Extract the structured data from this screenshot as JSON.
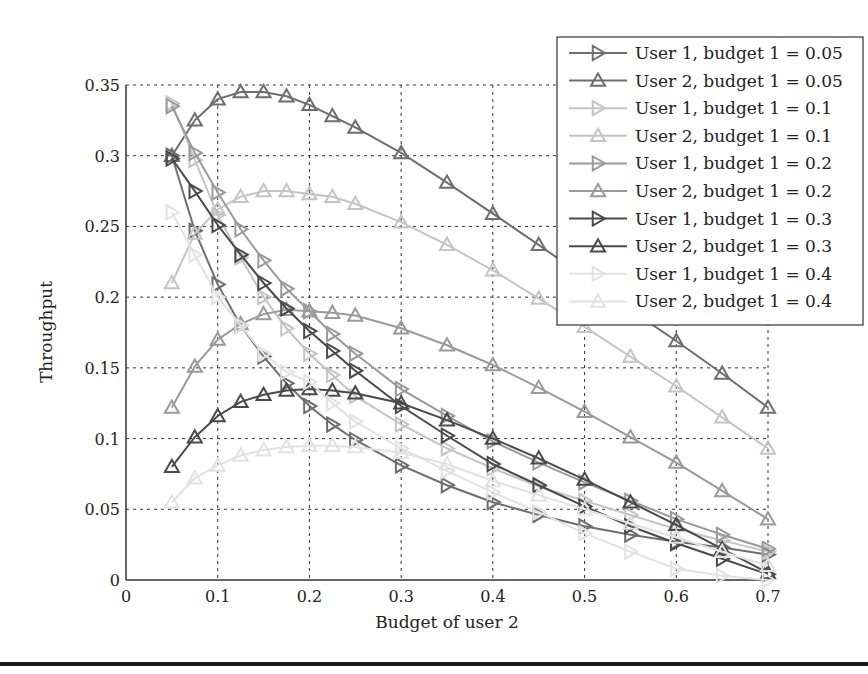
{
  "chart_data": {
    "type": "line",
    "title": "",
    "xlabel": "Budget of user 2",
    "ylabel": "Throughput",
    "xlim": [
      0,
      0.7
    ],
    "ylim": [
      0,
      0.35
    ],
    "xticks": [
      "0",
      "0.1",
      "0.2",
      "0.3",
      "0.4",
      "0.5",
      "0.6",
      "0.7"
    ],
    "yticks": [
      "0",
      "0.05",
      "0.1",
      "0.15",
      "0.2",
      "0.25",
      "0.3",
      "0.35"
    ],
    "grid": true,
    "legend_position": "upper right",
    "x": [
      0.05,
      0.075,
      0.1,
      0.125,
      0.15,
      0.175,
      0.2,
      0.225,
      0.25,
      0.3,
      0.35,
      0.4,
      0.45,
      0.5,
      0.55,
      0.6,
      0.65,
      0.7
    ],
    "series": [
      {
        "name": "User 1, budget 1 = 0.05",
        "marker": "triangle-right",
        "color": "#6e6e6e",
        "values": [
          0.3,
          0.247,
          0.209,
          0.18,
          0.158,
          0.139,
          0.123,
          0.11,
          0.099,
          0.081,
          0.067,
          0.055,
          0.046,
          0.038,
          0.032,
          0.027,
          0.023,
          0.018
        ]
      },
      {
        "name": "User 2, budget 1 = 0.05",
        "marker": "triangle-up",
        "color": "#6e6e6e",
        "values": [
          0.3,
          0.325,
          0.34,
          0.345,
          0.345,
          0.342,
          0.336,
          0.328,
          0.32,
          0.302,
          0.281,
          0.259,
          0.237,
          0.214,
          0.191,
          0.169,
          0.146,
          0.122
        ]
      },
      {
        "name": "User 1, budget 1 = 0.1",
        "marker": "triangle-right",
        "color": "#c4c4c4",
        "values": [
          0.337,
          0.297,
          0.258,
          0.228,
          0.2,
          0.178,
          0.16,
          0.145,
          0.13,
          0.11,
          0.093,
          0.079,
          0.066,
          0.056,
          0.046,
          0.036,
          0.028,
          0.02
        ]
      },
      {
        "name": "User 2, budget 1 = 0.1",
        "marker": "triangle-up",
        "color": "#c4c4c4",
        "values": [
          0.21,
          0.245,
          0.262,
          0.271,
          0.275,
          0.275,
          0.273,
          0.271,
          0.266,
          0.253,
          0.237,
          0.219,
          0.199,
          0.179,
          0.158,
          0.137,
          0.115,
          0.093
        ]
      },
      {
        "name": "User 1, budget 1 = 0.2",
        "marker": "triangle-right",
        "color": "#9a9a9a",
        "values": [
          0.335,
          0.302,
          0.274,
          0.248,
          0.226,
          0.206,
          0.19,
          0.174,
          0.16,
          0.135,
          0.116,
          0.098,
          0.083,
          0.069,
          0.056,
          0.043,
          0.032,
          0.022
        ]
      },
      {
        "name": "User 2, budget 1 = 0.2",
        "marker": "triangle-up",
        "color": "#9a9a9a",
        "values": [
          0.122,
          0.151,
          0.17,
          0.181,
          0.188,
          0.191,
          0.19,
          0.189,
          0.187,
          0.178,
          0.166,
          0.152,
          0.136,
          0.119,
          0.101,
          0.083,
          0.063,
          0.043
        ]
      },
      {
        "name": "User 1, budget 1 = 0.3",
        "marker": "triangle-right",
        "color": "#4a4a4a",
        "values": [
          0.298,
          0.275,
          0.251,
          0.23,
          0.21,
          0.192,
          0.176,
          0.162,
          0.148,
          0.123,
          0.102,
          0.082,
          0.067,
          0.052,
          0.038,
          0.026,
          0.015,
          0.004
        ]
      },
      {
        "name": "User 2, budget 1 = 0.3",
        "marker": "triangle-up",
        "color": "#4a4a4a",
        "values": [
          0.08,
          0.101,
          0.116,
          0.126,
          0.131,
          0.134,
          0.135,
          0.134,
          0.132,
          0.125,
          0.113,
          0.1,
          0.086,
          0.071,
          0.055,
          0.039,
          0.022,
          0.005
        ]
      },
      {
        "name": "User 1, budget 1 = 0.4",
        "marker": "triangle-right",
        "color": "#e2e2e2",
        "values": [
          0.26,
          0.23,
          0.2,
          0.18,
          0.16,
          0.147,
          0.14,
          0.125,
          0.112,
          0.093,
          0.077,
          0.062,
          0.048,
          0.033,
          0.02,
          0.008,
          0.003,
          0.0
        ]
      },
      {
        "name": "User 2, budget 1 = 0.4",
        "marker": "triangle-up",
        "color": "#e2e2e2",
        "values": [
          0.055,
          0.072,
          0.081,
          0.088,
          0.092,
          0.094,
          0.095,
          0.095,
          0.094,
          0.09,
          0.082,
          0.07,
          0.06,
          0.05,
          0.04,
          0.03,
          0.02,
          0.01
        ]
      }
    ]
  },
  "layout": {
    "plot": {
      "left": 126,
      "top": 85,
      "right": 768,
      "bottom": 580
    },
    "legend": {
      "left": 557,
      "top": 37,
      "width": 306,
      "row_height": 27.6
    }
  }
}
